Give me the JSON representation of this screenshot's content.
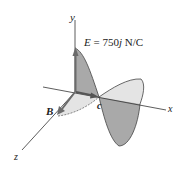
{
  "figure": {
    "axes": {
      "x_label": "x",
      "y_label": "y",
      "z_label": "z"
    },
    "labels": {
      "E_symbol": "E",
      "E_equation": " = 750",
      "E_unit_vector": "j",
      "E_units": " N/C",
      "B_symbol": "B",
      "c_symbol": "c"
    },
    "colors": {
      "axis_line": "#333333",
      "E_wave_fill": "#a9a9a9",
      "B_wave_fill": "#e4e4e4",
      "wave_outline": "#444444",
      "vector_arrow": "#6b6b6b"
    }
  }
}
